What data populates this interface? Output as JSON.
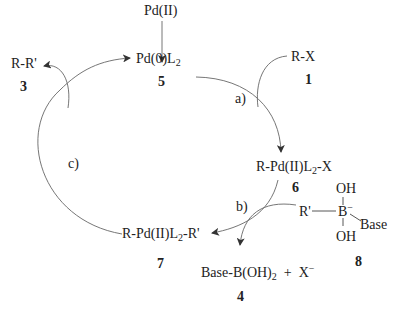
{
  "diagram": {
    "species": {
      "pd_ii": {
        "label": "Pd(II)"
      },
      "pd0": {
        "label_main": "Pd(0)L",
        "label_sub": "2",
        "number": "5"
      },
      "rx": {
        "label": "R-X",
        "number": "1"
      },
      "rr": {
        "label": "R-R'",
        "number": "3"
      },
      "oxadd": {
        "label_pre": "R-Pd(II)L",
        "label_sub": "2",
        "label_post": "-X",
        "number": "6"
      },
      "transmet": {
        "label_pre": "R-Pd(II)L",
        "label_sub": "2",
        "label_post": "-R'",
        "number": "7"
      },
      "borate": {
        "r": "R'",
        "b": "B",
        "charge": "−",
        "oh_top": "OH",
        "oh_bottom": "OH",
        "base": "Base",
        "number": "8"
      },
      "byproduct": {
        "label_pre": "Base-B(OH)",
        "label_sub": "2",
        "plus": "+",
        "x": "X",
        "x_charge": "−",
        "number": "4"
      }
    },
    "steps": {
      "a": "a)",
      "b": "b)",
      "c": "c)"
    },
    "colors": {
      "line": "#555555",
      "text": "#222222"
    }
  }
}
